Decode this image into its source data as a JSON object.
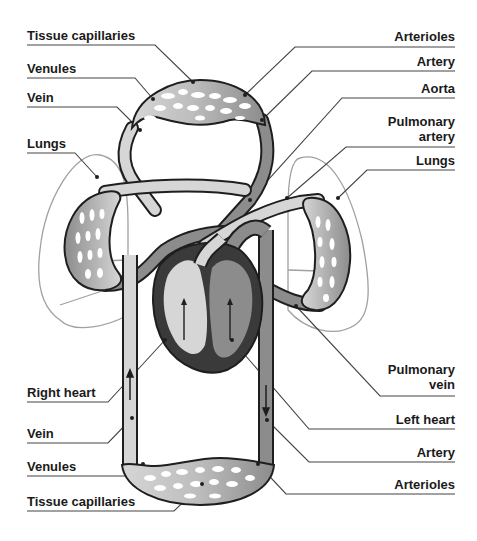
{
  "colors": {
    "deoxygenated": "#d6d6d6",
    "oxygenated": "#8c8c8c",
    "heart_wall": "#3a3a3a",
    "outline": "#1e1e1e",
    "lung_outline": "#9a9a9a",
    "leader_line": "#444444"
  },
  "labels": {
    "left": [
      {
        "text": "Tissue capillaries"
      },
      {
        "text": "Venules"
      },
      {
        "text": "Vein"
      },
      {
        "text": "Lungs"
      },
      {
        "text": "Right heart"
      },
      {
        "text": "Vein"
      },
      {
        "text": "Venules"
      },
      {
        "text": "Tissue capillaries"
      }
    ],
    "right": [
      {
        "text": "Arterioles"
      },
      {
        "text": "Artery"
      },
      {
        "text": "Aorta"
      },
      {
        "text": "Pulmonary",
        "text2": "artery"
      },
      {
        "text": "Lungs"
      },
      {
        "text": "Pulmonary",
        "text2": "vein"
      },
      {
        "text": "Left heart"
      },
      {
        "text": "Artery"
      },
      {
        "text": "Arterioles"
      }
    ]
  }
}
